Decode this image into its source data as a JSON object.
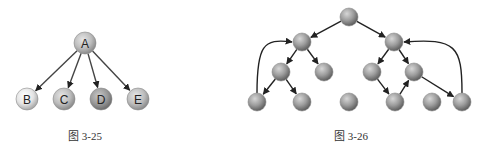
{
  "figures": [
    {
      "caption": "图 3-25",
      "nodes": [
        {
          "id": "A",
          "label": "A",
          "x": 85,
          "y": 43,
          "shade": "mid"
        },
        {
          "id": "B",
          "label": "B",
          "x": 27,
          "y": 99,
          "shade": "light"
        },
        {
          "id": "C",
          "label": "C",
          "x": 64,
          "y": 99,
          "shade": "mid"
        },
        {
          "id": "D",
          "label": "D",
          "x": 101,
          "y": 99,
          "shade": "dark"
        },
        {
          "id": "E",
          "label": "E",
          "x": 138,
          "y": 99,
          "shade": "mid"
        }
      ],
      "edges": [
        {
          "from": "A",
          "to": "B"
        },
        {
          "from": "A",
          "to": "C"
        },
        {
          "from": "A",
          "to": "D"
        },
        {
          "from": "A",
          "to": "E"
        }
      ]
    },
    {
      "caption": "图 3-26",
      "nodes": [
        {
          "id": "r",
          "x": 349,
          "y": 17
        },
        {
          "id": "L",
          "x": 302,
          "y": 42
        },
        {
          "id": "R",
          "x": 394,
          "y": 42
        },
        {
          "id": "LL",
          "x": 281,
          "y": 72
        },
        {
          "id": "LR",
          "x": 324,
          "y": 72
        },
        {
          "id": "RL",
          "x": 372,
          "y": 72
        },
        {
          "id": "RR",
          "x": 414,
          "y": 72
        },
        {
          "id": "LLL",
          "x": 257,
          "y": 102
        },
        {
          "id": "LLR",
          "x": 302,
          "y": 102
        },
        {
          "id": "M",
          "x": 349,
          "y": 102
        },
        {
          "id": "RLR",
          "x": 395,
          "y": 102
        },
        {
          "id": "X",
          "x": 432,
          "y": 102
        },
        {
          "id": "RRR",
          "x": 462,
          "y": 102
        }
      ],
      "edges": [
        {
          "from": "r",
          "to": "L"
        },
        {
          "from": "r",
          "to": "R"
        },
        {
          "from": "L",
          "to": "LL"
        },
        {
          "from": "L",
          "to": "LR"
        },
        {
          "from": "LL",
          "to": "LLL"
        },
        {
          "from": "LL",
          "to": "LLR"
        },
        {
          "from": "R",
          "to": "RL"
        },
        {
          "from": "R",
          "to": "RR"
        },
        {
          "from": "RL",
          "to": "RLR"
        },
        {
          "from": "RLR",
          "to": "RR"
        },
        {
          "from": "RR",
          "to": "RRR"
        },
        {
          "from": "LLL",
          "to": "L",
          "curved": true
        },
        {
          "from": "RRR",
          "to": "R",
          "curved": true
        }
      ]
    }
  ]
}
